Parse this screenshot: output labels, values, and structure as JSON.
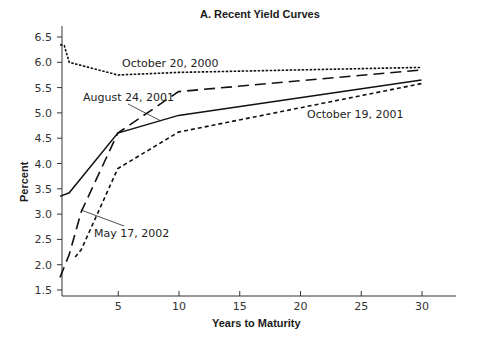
{
  "chart_data": {
    "type": "line",
    "title": "A.  Recent Yield Curves",
    "xlabel": "Years to Maturity",
    "ylabel": "Percent",
    "xlim": [
      0,
      33
    ],
    "ylim": [
      1.5,
      6.6
    ],
    "x_ticks": [
      5,
      10,
      15,
      20,
      25,
      30
    ],
    "x_tick_labels": [
      "5",
      "10",
      "15",
      "20",
      "25",
      "30"
    ],
    "y_ticks": [
      1.5,
      2.0,
      2.5,
      3.0,
      3.5,
      4.0,
      4.5,
      5.0,
      5.5,
      6.0,
      6.5
    ],
    "y_tick_labels": [
      "1.5",
      "2.0",
      "2.5",
      "3.0",
      "3.5",
      "4.0",
      "4.5",
      "5.0",
      "5.5",
      "6.0",
      "6.5"
    ],
    "grid": false,
    "legend": "inline annotations",
    "series": [
      {
        "name": "October 20, 2000",
        "style": "dotted",
        "x": [
          0.25,
          0.6,
          1,
          5,
          10,
          30
        ],
        "values": [
          6.35,
          6.33,
          6.0,
          5.75,
          5.8,
          5.9
        ]
      },
      {
        "name": "August 24, 2001",
        "style": "solid",
        "x": [
          0.25,
          1,
          5,
          10,
          30
        ],
        "values": [
          3.35,
          3.42,
          4.6,
          4.95,
          5.65
        ]
      },
      {
        "name": "October 19, 2001",
        "style": "short-dash",
        "x": [
          1.5,
          2,
          5,
          10,
          30
        ],
        "values": [
          2.15,
          2.3,
          3.9,
          4.62,
          5.58
        ]
      },
      {
        "name": "May 17, 2002",
        "style": "long-dash",
        "x": [
          0.25,
          1,
          2,
          5,
          10,
          30
        ],
        "values": [
          1.75,
          2.2,
          3.05,
          4.6,
          5.42,
          5.85
        ]
      }
    ],
    "annotations": [
      {
        "text": "October 20, 2000",
        "x": 12,
        "y": 5.95
      },
      {
        "text": "August 24, 2001",
        "x": 6.5,
        "y": 5.3,
        "leader_to": [
          9.5,
          4.83
        ]
      },
      {
        "text": "October 19, 2001",
        "x": 23.5,
        "y": 4.95
      },
      {
        "text": "May 17, 2002",
        "x": 6.5,
        "y": 2.75,
        "leader_to": [
          2.0,
          3.07
        ]
      }
    ]
  },
  "labels": {
    "title": "A.  Recent Yield Curves",
    "xlabel": "Years to Maturity",
    "ylabel": "Percent",
    "ann_oct2000": "October 20, 2000",
    "ann_aug2001": "August 24, 2001",
    "ann_oct2001": "October 19, 2001",
    "ann_may2002": "May 17, 2002"
  }
}
